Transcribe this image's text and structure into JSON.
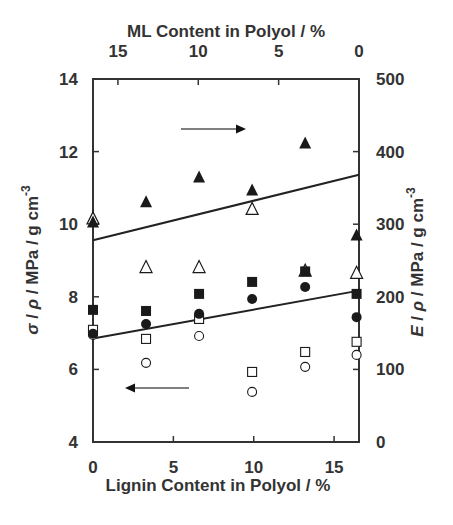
{
  "chart_data": {
    "type": "scatter",
    "title": "",
    "xlabel": "Lignin Content in Polyol / %",
    "x2label": "ML Content in Polyol / %",
    "ylabel": "σ / ρ / MPa / g cm-3",
    "y2label": "E / ρ / MPa / g cm-3",
    "xlim": [
      0,
      16.55
    ],
    "ylim": [
      4,
      14
    ],
    "y2lim": [
      0,
      500
    ],
    "x_ticks": [
      0,
      5,
      10,
      15
    ],
    "x2_ticks": [
      15,
      10,
      5,
      0
    ],
    "x2_note": "ML content axis runs reversed (0 at right edge)",
    "y_ticks": [
      4,
      6,
      8,
      10,
      12,
      14
    ],
    "y2_ticks": [
      0,
      100,
      200,
      300,
      400,
      500
    ],
    "grid": false,
    "legend": null,
    "annotations": [
      {
        "type": "arrow",
        "direction": "right",
        "meaning": "triangles refer to right axis (E/ρ)"
      },
      {
        "type": "arrow",
        "direction": "left",
        "meaning": "circles and squares refer to left axis (σ/ρ)"
      }
    ],
    "x": [
      0,
      3.3,
      6.6,
      9.9,
      13.2,
      16.4
    ],
    "series": [
      {
        "name": "filled triangle (E/ρ)",
        "axis": "right",
        "marker": "triangle",
        "filled": true,
        "values": [
          303,
          331,
          365,
          347,
          412,
          285
        ]
      },
      {
        "name": "open triangle (E/ρ)",
        "axis": "right",
        "marker": "triangle",
        "filled": false,
        "values": [
          308,
          241,
          241,
          321,
          236,
          233
        ]
      },
      {
        "name": "filled square (σ/ρ)",
        "axis": "left",
        "marker": "square",
        "filled": true,
        "values": [
          7.64,
          7.61,
          8.08,
          8.41,
          8.7,
          8.08
        ]
      },
      {
        "name": "filled circle (σ/ρ)",
        "axis": "left",
        "marker": "circle",
        "filled": true,
        "values": [
          6.98,
          7.25,
          7.53,
          7.94,
          8.27,
          7.44
        ]
      },
      {
        "name": "open square (σ/ρ)",
        "axis": "left",
        "marker": "square",
        "filled": false,
        "values": [
          7.09,
          6.84,
          7.39,
          5.93,
          6.48,
          6.76
        ]
      },
      {
        "name": "open circle (σ/ρ)",
        "axis": "left",
        "marker": "circle",
        "filled": false,
        "values": [
          6.95,
          6.18,
          6.92,
          5.38,
          6.07,
          6.4
        ]
      }
    ],
    "trend_lines": [
      {
        "name": "upper fit",
        "axis": "right",
        "x": [
          0,
          16.55
        ],
        "values": [
          278,
          368
        ]
      },
      {
        "name": "lower fit",
        "axis": "left",
        "x": [
          0,
          16.55
        ],
        "values": [
          6.85,
          8.17
        ]
      }
    ]
  },
  "labels": {
    "top_title": "ML Content in Polyol / %",
    "bottom_title": "Lignin Content in Polyol / %"
  },
  "colors": {
    "axis": "#333333",
    "marker": "#1a1a1a",
    "arrow": "#555555"
  }
}
